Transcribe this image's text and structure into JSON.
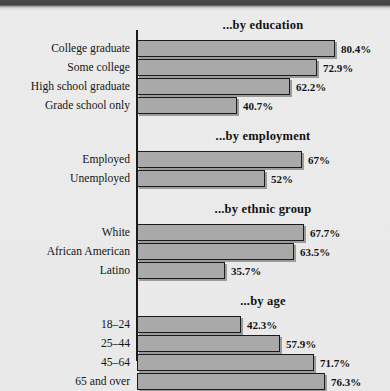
{
  "chart_data": {
    "type": "bar",
    "title": "",
    "orientation": "horizontal",
    "xlabel": "",
    "ylabel": "",
    "xlim": [
      0,
      100
    ],
    "grid": false,
    "legend": "none",
    "value_suffix": "%",
    "panels": [
      {
        "title": "...by education",
        "categories": [
          "College graduate",
          "Some college",
          "High school graduate",
          "Grade school only"
        ],
        "values": [
          80.4,
          72.9,
          62.2,
          40.7
        ],
        "labels": [
          "80.4%",
          "72.9%",
          "62.2%",
          "40.7%"
        ]
      },
      {
        "title": "...by employment",
        "categories": [
          "Employed",
          "Unemployed"
        ],
        "values": [
          67,
          52
        ],
        "labels": [
          "67%",
          "52%"
        ]
      },
      {
        "title": "...by ethnic group",
        "categories": [
          "White",
          "African American",
          "Latino"
        ],
        "values": [
          67.7,
          63.5,
          35.7
        ],
        "labels": [
          "67.7%",
          "63.5%",
          "35.7%"
        ]
      },
      {
        "title": "...by age",
        "categories": [
          "18–24",
          "25–44",
          "45–64",
          "65 and over"
        ],
        "values": [
          42.3,
          57.9,
          71.7,
          76.3
        ],
        "labels": [
          "42.3%",
          "57.9%",
          "71.7%",
          "76.3%"
        ]
      }
    ]
  },
  "colors": {
    "background": "#eaeaea",
    "bar_fill": "#a9a9a9",
    "bar_outline": "#1b1b1b",
    "axis": "#191919",
    "text": "#151515",
    "top_band": "#3f3f3f"
  }
}
